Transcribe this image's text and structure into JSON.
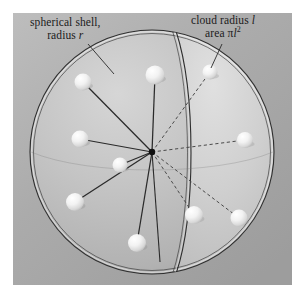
{
  "figure": {
    "type": "diagram",
    "background_color": "#ffffff",
    "panel_color": "#a9a9a9",
    "panel": {
      "x": 13,
      "y": 13,
      "width": 279,
      "height": 272
    },
    "labels": {
      "shell": {
        "line1": "spherical shell,",
        "line2_prefix": "radius ",
        "line2_symbol": "r",
        "leader_from": [
          88,
          44
        ],
        "leader_to": [
          112,
          72
        ]
      },
      "cloud": {
        "line1_prefix": "cloud radius ",
        "line1_symbol": "l",
        "line2_prefix": "area ",
        "line2_pi": "π",
        "line2_symbol": "l",
        "line2_exponent": "2",
        "leader_from": [
          222,
          44
        ],
        "leader_to": [
          211,
          70
        ]
      }
    },
    "geometry": {
      "center_dot": {
        "cx": 152,
        "cy": 152,
        "r": 3.2,
        "color": "#101010"
      },
      "sphere": {
        "cx": 152,
        "cy": 152,
        "r": 122
      },
      "shell_outline_color": "#2c2c2c",
      "radial_line_color": "#2a2a2a",
      "dashed_line_color": "#4a4a4a",
      "sphere_fill_light": "#d3d3d3",
      "sphere_fill_dark": "#9a9a9a"
    },
    "particles": [
      {
        "name": "particle-upper-left",
        "cx": 83,
        "cy": 82,
        "r": 8.5,
        "link": "solid"
      },
      {
        "name": "particle-top",
        "cx": 155,
        "cy": 75,
        "r": 9.5,
        "link": "solid"
      },
      {
        "name": "particle-top-right",
        "cx": 210,
        "cy": 72,
        "r": 7.5,
        "link": "dashed"
      },
      {
        "name": "particle-left",
        "cx": 80,
        "cy": 139,
        "r": 8.5,
        "link": "solid"
      },
      {
        "name": "particle-right",
        "cx": 245,
        "cy": 140,
        "r": 8.0,
        "link": "dashed"
      },
      {
        "name": "particle-inner-left",
        "cx": 120,
        "cy": 165,
        "r": 7.5,
        "link": "solid"
      },
      {
        "name": "particle-lower-left",
        "cx": 75,
        "cy": 202,
        "r": 9.0,
        "link": "solid"
      },
      {
        "name": "particle-bottom",
        "cx": 137,
        "cy": 243,
        "r": 9.0,
        "link": "solid"
      },
      {
        "name": "particle-lower-mid",
        "cx": 194,
        "cy": 215,
        "r": 9.0,
        "link": "dashed"
      },
      {
        "name": "particle-lower-right",
        "cx": 239,
        "cy": 218,
        "r": 8.5,
        "link": "dashed"
      }
    ]
  }
}
